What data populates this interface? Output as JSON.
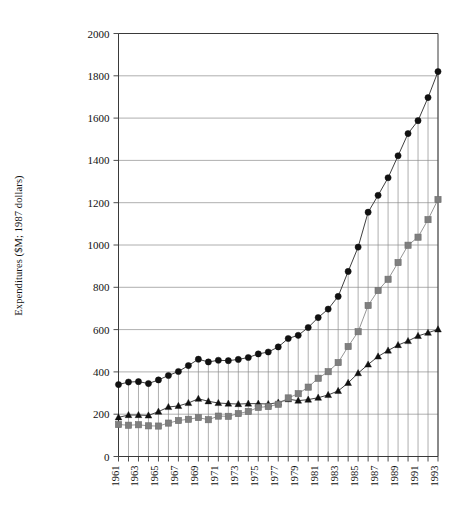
{
  "chart_data": {
    "type": "line",
    "title": "",
    "xlabel": "",
    "ylabel": "Expenditures ($M; 1987 dollars)",
    "ylim": [
      0,
      2000
    ],
    "ytick_step": 200,
    "yticks": [
      0,
      200,
      400,
      600,
      800,
      1000,
      1200,
      1400,
      1600,
      1800,
      2000
    ],
    "grid": true,
    "legend_position": "none",
    "x": [
      1961,
      1962,
      1963,
      1964,
      1965,
      1966,
      1967,
      1968,
      1969,
      1970,
      1971,
      1972,
      1973,
      1974,
      1975,
      1976,
      1977,
      1978,
      1979,
      1980,
      1981,
      1982,
      1983,
      1984,
      1985,
      1986,
      1987,
      1988,
      1989,
      1990,
      1991,
      1992,
      1993
    ],
    "xtick_labels": [
      "1961",
      "",
      "1963",
      "",
      "1965",
      "",
      "1967",
      "",
      "1969",
      "",
      "1971",
      "",
      "1973",
      "",
      "1975",
      "",
      "1977",
      "",
      "1979",
      "",
      "1981",
      "",
      "1983",
      "",
      "1985",
      "",
      "1987",
      "",
      "1989",
      "",
      "1991",
      "",
      "1993"
    ],
    "xtick_labels_shown": [
      "1961",
      "1963",
      "1965",
      "1967",
      "1969",
      "1971",
      "1973",
      "1975",
      "1977",
      "1979",
      "1981",
      "1983",
      "1985",
      "1987",
      "1989",
      "1991",
      "1993"
    ],
    "series": [
      {
        "name": "total",
        "marker": "circle",
        "color": "#111111",
        "values": [
          340,
          352,
          354,
          345,
          362,
          383,
          402,
          430,
          460,
          447,
          455,
          453,
          459,
          468,
          485,
          494,
          518,
          558,
          573,
          610,
          657,
          697,
          757,
          875,
          990,
          1155,
          1235,
          1318,
          1422,
          1527,
          1588,
          1697,
          1820
        ]
      },
      {
        "name": "series-triangle",
        "marker": "triangle",
        "color": "#111111",
        "values": [
          185,
          196,
          196,
          194,
          212,
          234,
          239,
          253,
          273,
          261,
          253,
          250,
          248,
          250,
          250,
          248,
          255,
          271,
          264,
          269,
          278,
          291,
          310,
          348,
          394,
          435,
          473,
          501,
          527,
          546,
          570,
          585,
          601
        ]
      },
      {
        "name": "series-square",
        "marker": "square",
        "color": "#7f7f7f",
        "values": [
          151,
          148,
          150,
          145,
          144,
          158,
          170,
          176,
          184,
          174,
          191,
          190,
          203,
          213,
          232,
          236,
          247,
          277,
          297,
          328,
          370,
          401,
          444,
          520,
          590,
          714,
          785,
          838,
          917,
          999,
          1037,
          1120,
          1215
        ]
      }
    ]
  },
  "axis": {
    "y_axis_title": "Expenditures ($M; 1987 dollars)"
  },
  "colors": {
    "line_dark": "#111111",
    "line_gray": "#7f7f7f",
    "grid": "#9a9a9a",
    "axis": "#3a3a3a",
    "background": "#ffffff"
  }
}
